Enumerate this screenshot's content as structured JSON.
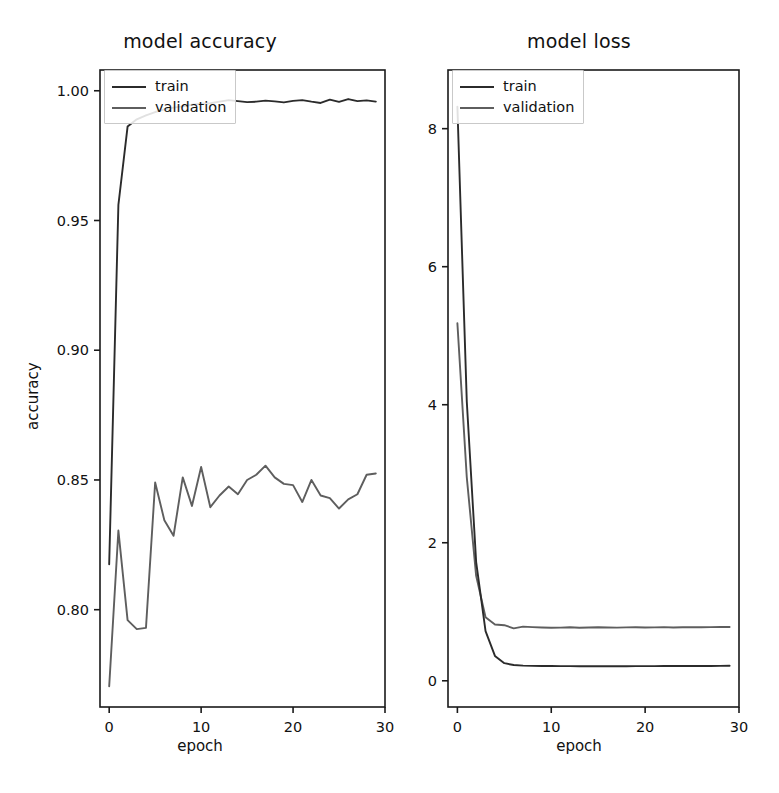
{
  "figure": {
    "background": "#ffffff",
    "width": 779,
    "height": 793
  },
  "colors": {
    "train_line": "#2b2b2b",
    "validation_line": "#5e5e5e",
    "axis": "#1a1a1a",
    "legend_border": "#c9c9c9",
    "text": "#111111"
  },
  "legend": {
    "train_label": "train",
    "validation_label": "validation"
  },
  "accuracy_axis": {
    "yticks": [
      "0.80",
      "0.85",
      "0.90",
      "0.95",
      "1.00"
    ],
    "xticks": [
      "0",
      "10",
      "20",
      "30"
    ]
  },
  "loss_axis": {
    "yticks": [
      "0",
      "2",
      "4",
      "6",
      "8"
    ],
    "xticks": [
      "0",
      "10",
      "20",
      "30"
    ]
  },
  "chart_data": [
    {
      "type": "line",
      "title": "model accuracy",
      "xlabel": "epoch",
      "ylabel": "accuracy",
      "xlim": [
        -1.0,
        30.0
      ],
      "ylim": [
        0.7625,
        1.008
      ],
      "xticks": [
        0,
        10,
        20,
        30
      ],
      "yticks": [
        0.8,
        0.85,
        0.9,
        0.95,
        1.0
      ],
      "grid": false,
      "legend_position": "upper left",
      "x": [
        0,
        1,
        2,
        3,
        4,
        5,
        6,
        7,
        8,
        9,
        10,
        11,
        12,
        13,
        14,
        15,
        16,
        17,
        18,
        19,
        20,
        21,
        22,
        23,
        24,
        25,
        26,
        27,
        28,
        29
      ],
      "series": [
        {
          "name": "train",
          "color": "#2b2b2b",
          "values": [
            0.8175,
            0.956,
            0.9862,
            0.989,
            0.9905,
            0.9918,
            0.9928,
            0.9935,
            0.994,
            0.9946,
            0.995,
            0.9952,
            0.9958,
            0.9964,
            0.996,
            0.9956,
            0.9958,
            0.9962,
            0.9959,
            0.9955,
            0.9961,
            0.9964,
            0.9958,
            0.9953,
            0.9966,
            0.9957,
            0.9968,
            0.996,
            0.9963,
            0.9958
          ]
        },
        {
          "name": "validation",
          "color": "#5e5e5e",
          "values": [
            0.7705,
            0.8305,
            0.796,
            0.7925,
            0.793,
            0.849,
            0.8345,
            0.8285,
            0.851,
            0.84,
            0.855,
            0.8395,
            0.844,
            0.8475,
            0.8445,
            0.85,
            0.852,
            0.8555,
            0.851,
            0.8485,
            0.848,
            0.8415,
            0.85,
            0.844,
            0.843,
            0.839,
            0.8425,
            0.8445,
            0.852,
            0.8525
          ]
        }
      ]
    },
    {
      "type": "line",
      "title": "model loss",
      "xlabel": "epoch",
      "ylabel": "loss",
      "xlim": [
        -1.0,
        30.0
      ],
      "ylim": [
        -0.38,
        8.85
      ],
      "xticks": [
        0,
        10,
        20,
        30
      ],
      "yticks": [
        0,
        2,
        4,
        6,
        8
      ],
      "grid": false,
      "legend_position": "upper left",
      "x": [
        0,
        1,
        2,
        3,
        4,
        5,
        6,
        7,
        8,
        9,
        10,
        11,
        12,
        13,
        14,
        15,
        16,
        17,
        18,
        19,
        20,
        21,
        22,
        23,
        24,
        25,
        26,
        27,
        28,
        29
      ],
      "series": [
        {
          "name": "train",
          "color": "#2b2b2b",
          "values": [
            8.32,
            4.05,
            1.72,
            0.72,
            0.36,
            0.255,
            0.228,
            0.22,
            0.216,
            0.214,
            0.213,
            0.212,
            0.212,
            0.211,
            0.211,
            0.211,
            0.211,
            0.211,
            0.211,
            0.212,
            0.212,
            0.212,
            0.213,
            0.213,
            0.214,
            0.214,
            0.215,
            0.215,
            0.216,
            0.217
          ]
        },
        {
          "name": "validation",
          "color": "#5e5e5e",
          "values": [
            5.18,
            2.95,
            1.52,
            0.92,
            0.815,
            0.805,
            0.76,
            0.785,
            0.778,
            0.772,
            0.768,
            0.77,
            0.775,
            0.768,
            0.772,
            0.776,
            0.772,
            0.77,
            0.774,
            0.776,
            0.772,
            0.774,
            0.777,
            0.773,
            0.775,
            0.778,
            0.775,
            0.777,
            0.779,
            0.78
          ]
        }
      ]
    }
  ]
}
